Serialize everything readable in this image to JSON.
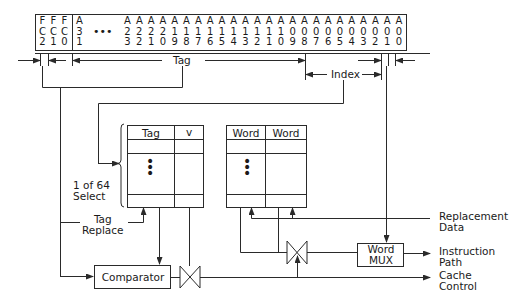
{
  "register": {
    "fc_bits": [
      {
        "top": "F",
        "mid": "C",
        "bot": "2"
      },
      {
        "top": "F",
        "mid": "C",
        "bot": "1"
      },
      {
        "top": "F",
        "mid": "C",
        "bot": "0"
      }
    ],
    "address_bits": [
      {
        "top": "A",
        "mid": "3",
        "bot": "1"
      },
      {
        "top": "A",
        "mid": "2",
        "bot": "3"
      },
      {
        "top": "A",
        "mid": "2",
        "bot": "2"
      },
      {
        "top": "A",
        "mid": "2",
        "bot": "1"
      },
      {
        "top": "A",
        "mid": "2",
        "bot": "0"
      },
      {
        "top": "A",
        "mid": "1",
        "bot": "9"
      },
      {
        "top": "A",
        "mid": "1",
        "bot": "8"
      },
      {
        "top": "A",
        "mid": "1",
        "bot": "7"
      },
      {
        "top": "A",
        "mid": "1",
        "bot": "6"
      },
      {
        "top": "A",
        "mid": "1",
        "bot": "5"
      },
      {
        "top": "A",
        "mid": "1",
        "bot": "4"
      },
      {
        "top": "A",
        "mid": "1",
        "bot": "3"
      },
      {
        "top": "A",
        "mid": "1",
        "bot": "2"
      },
      {
        "top": "A",
        "mid": "1",
        "bot": "1"
      },
      {
        "top": "A",
        "mid": "1",
        "bot": "0"
      },
      {
        "top": "A",
        "mid": "0",
        "bot": "9"
      },
      {
        "top": "A",
        "mid": "0",
        "bot": "8"
      },
      {
        "top": "A",
        "mid": "0",
        "bot": "7"
      },
      {
        "top": "A",
        "mid": "0",
        "bot": "6"
      },
      {
        "top": "A",
        "mid": "0",
        "bot": "5"
      },
      {
        "top": "A",
        "mid": "0",
        "bot": "4"
      },
      {
        "top": "A",
        "mid": "0",
        "bot": "3"
      },
      {
        "top": "A",
        "mid": "0",
        "bot": "2"
      },
      {
        "top": "A",
        "mid": "0",
        "bot": "1"
      },
      {
        "top": "A",
        "mid": "0",
        "bot": "0"
      }
    ],
    "ellipsis": "•••"
  },
  "fields": {
    "tag": "Tag",
    "index": "Index"
  },
  "tag_array": {
    "col_tag": "Tag",
    "col_valid": "v",
    "dots": "⋮"
  },
  "data_array": {
    "col_word1": "Word",
    "col_word2": "Word",
    "dots": "⋮"
  },
  "labels": {
    "select_line1": "1 of 64",
    "select_line2": "Select",
    "tag_replace_line1": "Tag",
    "tag_replace_line2": "Replace",
    "replacement_line1": "Replacement",
    "replacement_line2": "Data",
    "instruction_line1": "Instruction",
    "instruction_line2": "Path",
    "cache_control_line1": "Cache",
    "cache_control_line2": "Control"
  },
  "blocks": {
    "comparator": "Comparator",
    "word_mux_line1": "Word",
    "word_mux_line2": "MUX"
  },
  "colors": {
    "line": "#2a2a2a",
    "background": "#ffffff"
  }
}
